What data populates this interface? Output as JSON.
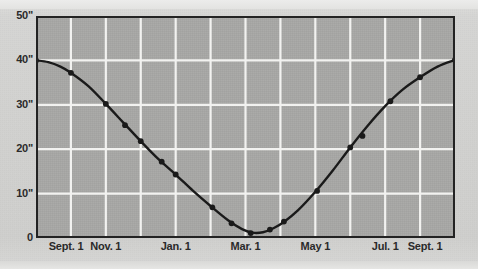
{
  "figure": {
    "background_color": "#d2d2d0",
    "plot_background_color": "#a8a8a6",
    "grid_color": "#f2f2f0",
    "curve_color": "#1a1a1a",
    "frame_color": "#232323",
    "text_color": "#2a2a2a"
  },
  "chart_data": {
    "type": "line",
    "title": "",
    "subtitle": "",
    "xlabel": "",
    "ylabel": "",
    "grid": true,
    "legend": "none",
    "xlim": [
      0,
      12
    ],
    "ylim": [
      0,
      50
    ],
    "y_tick_labels": [
      "50\"",
      "40\"",
      "30\"",
      "20\"",
      "10\"",
      "0"
    ],
    "y_tick_values": [
      50,
      40,
      30,
      20,
      10,
      0
    ],
    "x_tick_labels": [
      "Sept. 1",
      "Nov. 1",
      "Jan. 1",
      "Mar. 1",
      "May 1",
      "Jul. 1",
      "Sept. 1"
    ],
    "x_tick_values": [
      0,
      2,
      4,
      6,
      8,
      10,
      12
    ],
    "x_minor_gridlines": [
      1,
      2,
      3,
      4,
      5,
      6,
      7,
      8,
      9,
      10,
      11
    ],
    "y_gridlines": [
      10,
      20,
      30,
      40
    ],
    "series": [
      {
        "name": "Depth",
        "units": "inches",
        "line_points": [
          {
            "x": 0.0,
            "y": 40.0
          },
          {
            "x": 0.35,
            "y": 39.6
          },
          {
            "x": 0.7,
            "y": 38.6
          },
          {
            "x": 1.0,
            "y": 37.2
          },
          {
            "x": 1.5,
            "y": 34.2
          },
          {
            "x": 2.0,
            "y": 30.2
          },
          {
            "x": 2.5,
            "y": 26.0
          },
          {
            "x": 3.0,
            "y": 21.8
          },
          {
            "x": 3.5,
            "y": 17.8
          },
          {
            "x": 4.0,
            "y": 14.3
          },
          {
            "x": 4.5,
            "y": 10.6
          },
          {
            "x": 5.0,
            "y": 7.2
          },
          {
            "x": 5.5,
            "y": 4.0
          },
          {
            "x": 5.9,
            "y": 2.0
          },
          {
            "x": 6.2,
            "y": 1.2
          },
          {
            "x": 6.5,
            "y": 1.3
          },
          {
            "x": 6.8,
            "y": 2.2
          },
          {
            "x": 7.1,
            "y": 3.6
          },
          {
            "x": 7.5,
            "y": 6.2
          },
          {
            "x": 8.0,
            "y": 10.4
          },
          {
            "x": 8.5,
            "y": 15.2
          },
          {
            "x": 9.0,
            "y": 20.4
          },
          {
            "x": 9.5,
            "y": 25.3
          },
          {
            "x": 10.0,
            "y": 29.7
          },
          {
            "x": 10.5,
            "y": 33.4
          },
          {
            "x": 11.0,
            "y": 36.2
          },
          {
            "x": 11.5,
            "y": 38.6
          },
          {
            "x": 12.0,
            "y": 40.1
          }
        ],
        "markers": [
          {
            "x": 0.0,
            "y": 40.0
          },
          {
            "x": 1.0,
            "y": 37.2
          },
          {
            "x": 2.0,
            "y": 30.2
          },
          {
            "x": 2.55,
            "y": 25.4
          },
          {
            "x": 3.0,
            "y": 21.8
          },
          {
            "x": 3.6,
            "y": 17.2
          },
          {
            "x": 4.0,
            "y": 14.3
          },
          {
            "x": 5.05,
            "y": 6.9
          },
          {
            "x": 5.6,
            "y": 3.3
          },
          {
            "x": 6.15,
            "y": 1.1
          },
          {
            "x": 6.7,
            "y": 1.9
          },
          {
            "x": 7.1,
            "y": 3.7
          },
          {
            "x": 8.05,
            "y": 10.6
          },
          {
            "x": 9.0,
            "y": 20.4
          },
          {
            "x": 9.35,
            "y": 23.0
          },
          {
            "x": 10.15,
            "y": 30.8
          },
          {
            "x": 11.0,
            "y": 36.2
          },
          {
            "x": 12.0,
            "y": 40.1
          }
        ]
      }
    ]
  }
}
